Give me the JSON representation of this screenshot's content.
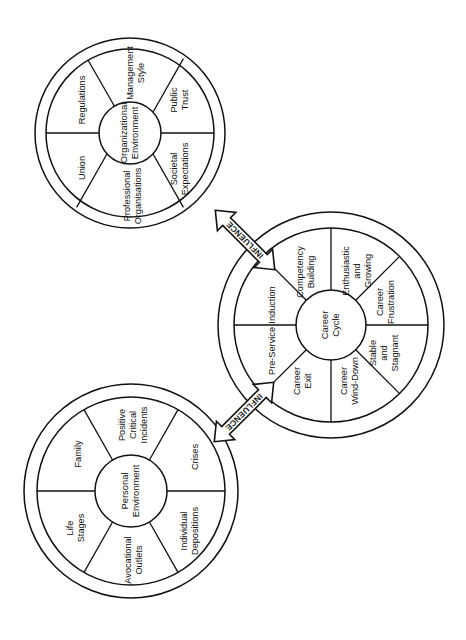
{
  "diagram": {
    "wheels": [
      {
        "id": "organizational-environment",
        "center_label": "Organizational\nEnvironment",
        "center_label_lines": [
          "Organizational",
          "Environment"
        ],
        "cx": 130,
        "cy": 133,
        "r_outer": 95,
        "r_ring_inner": 84,
        "r_core": 31,
        "segment_count": 8,
        "start_angle": 0,
        "segments": [
          {
            "label_lines": [
              "Public",
              "Trust"
            ]
          },
          {
            "label_lines": [
              "Management",
              "Style"
            ]
          },
          {
            "label_lines": [
              "Regulations"
            ]
          },
          {
            "label_lines": [
              "Union"
            ]
          },
          {
            "label_lines": [
              "Professional",
              "Organisations"
            ]
          },
          {
            "label_lines": [
              "Societal",
              "Expectations"
            ]
          }
        ]
      },
      {
        "id": "career-cycle",
        "center_label": "Career\nCycle",
        "center_label_lines": [
          "Career",
          "Cycle"
        ],
        "cx": 331,
        "cy": 325,
        "r_outer": 113,
        "r_ring_inner": 97,
        "r_core": 35,
        "segment_count": 8,
        "segments": [
          {
            "label_lines": [
              "Enthusiastic",
              "and",
              "Growing"
            ]
          },
          {
            "label_lines": [
              "Competency",
              "Building"
            ]
          },
          {
            "label_lines": [
              "Induction"
            ]
          },
          {
            "label_lines": [
              "Pre-Service"
            ]
          },
          {
            "label_lines": [
              "Career",
              "Exit"
            ]
          },
          {
            "label_lines": [
              "Career",
              "Wind-Down"
            ]
          },
          {
            "label_lines": [
              "Stable",
              "and",
              "Stagnant"
            ]
          },
          {
            "label_lines": [
              "Career",
              "Frustration"
            ]
          }
        ]
      },
      {
        "id": "personal-environment",
        "center_label": "Personal\nEnvironment",
        "center_label_lines": [
          "Personal",
          "Environment"
        ],
        "cx": 131,
        "cy": 491,
        "r_outer": 107,
        "r_ring_inner": 94,
        "r_core": 36,
        "segment_count": 6,
        "segments": [
          {
            "label_lines": [
              "Crises"
            ]
          },
          {
            "label_lines": [
              "Positive",
              "Critical",
              "Incidents"
            ]
          },
          {
            "label_lines": [
              "Family"
            ]
          },
          {
            "label_lines": [
              "Life",
              "Stages"
            ]
          },
          {
            "label_lines": [
              "Avocational",
              "Outlets"
            ]
          },
          {
            "label_lines": [
              "Individual",
              "Depositions"
            ]
          }
        ]
      }
    ],
    "connectors": [
      {
        "id": "influence-top",
        "label": "INFLUENCE",
        "from": "organizational-environment",
        "to": "career-cycle",
        "double_headed": true
      },
      {
        "id": "influence-bottom",
        "label": "INFLUENCE",
        "from": "personal-environment",
        "to": "career-cycle",
        "double_headed": true
      }
    ],
    "colors": {
      "stroke": "#111111",
      "fill": "#ffffff",
      "text": "#111111"
    }
  }
}
